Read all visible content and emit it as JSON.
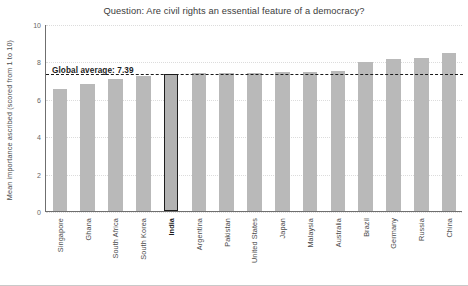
{
  "chart_data": {
    "type": "bar",
    "title": "Question: Are civil rights an essential feature of a democracy?",
    "xlabel": "",
    "ylabel": "Mean importance ascribed (scored from 1 to 10)",
    "ylim": [
      0,
      10
    ],
    "yticks": [
      0,
      2,
      4,
      6,
      8,
      10
    ],
    "grid": true,
    "legend": "none",
    "categories": [
      "Singapore",
      "Ghana",
      "South Africa",
      "South Korea",
      "India",
      "Argentina",
      "Pakistan",
      "United States",
      "Japan",
      "Malaysia",
      "Australia",
      "Brazil",
      "Germany",
      "Russia",
      "China"
    ],
    "values": [
      6.5,
      6.8,
      7.05,
      7.2,
      7.35,
      7.4,
      7.4,
      7.4,
      7.45,
      7.45,
      7.5,
      7.95,
      8.15,
      8.2,
      8.45
    ],
    "highlight_category": "India",
    "annotations": [
      {
        "name": "global-average",
        "label": "Global average: 7.39",
        "value": 7.39,
        "style": "dashed-horizontal-line"
      }
    ],
    "colors": {
      "bar": "#b9b9b9",
      "bar_highlight_border": "#1d1d1d",
      "average_line": "#1a1a1a",
      "axis": "#6f6f6f",
      "grid": "#dcdcdc",
      "title_text": "#3b3b3b"
    }
  }
}
